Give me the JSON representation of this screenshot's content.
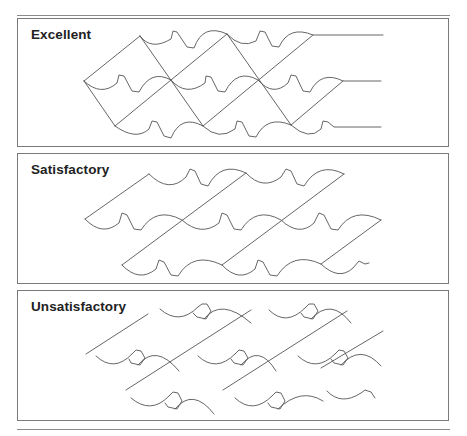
{
  "figure": {
    "title_cutoff": "",
    "panels": [
      {
        "id": "excellent",
        "label": "Excellent",
        "description": "Tightly aligned wavy rows with continuous diagonal tie lines forming a lattice; rows end in straight lead lines"
      },
      {
        "id": "satisfactory",
        "label": "Satisfactory",
        "description": "Wavy rows with parallel diagonal connectors, slightly offset"
      },
      {
        "id": "unsatisfactory",
        "label": "Unsatisfactory",
        "description": "Broken, disconnected arc segments with misaligned diagonal lines"
      }
    ]
  },
  "colors": {
    "line": "#555555",
    "border": "#7a7a7a",
    "label": "#222222",
    "background": "#ffffff"
  }
}
